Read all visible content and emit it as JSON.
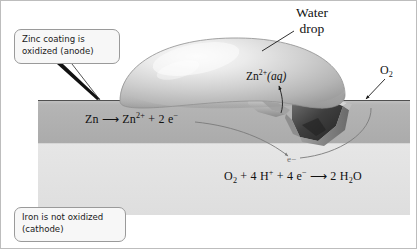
{
  "figure": {
    "background_color": "#ffffff",
    "border_color": "#bdbdbd"
  },
  "callouts": [
    {
      "id": "anode",
      "text": "Zinc coating is\noxidized (anode)",
      "fill": "#f7f7f7",
      "border": "#9a9a9a"
    },
    {
      "id": "cathode",
      "text": "Iron is not oxidized\n(cathode)",
      "fill": "#f7f7f7",
      "border": "#9a9a9a"
    }
  ],
  "labels": {
    "water_drop_line1": "Water",
    "water_drop_line2": "drop",
    "zinc_ion": {
      "species": "Zn",
      "charge": "2+",
      "state": "(aq)"
    },
    "oxygen": {
      "species": "O",
      "count": "2"
    },
    "electron": "e−"
  },
  "equations": {
    "anode": {
      "full": "Zn ⟶ Zn2+ + 2 e−",
      "reactant": "Zn",
      "arrow": "⟶",
      "product_species": "Zn",
      "product_charge": "2+",
      "plus": "+",
      "electrons_count": "2",
      "electron_symbol": "e",
      "electron_charge": "−"
    },
    "cathode": {
      "full": "O2 + 4 H+ + 4 e− ⟶ 2 H2O",
      "o2_species": "O",
      "o2_sub": "2",
      "plus1": "+",
      "h_count": "4",
      "h_species": "H",
      "h_charge": "+",
      "plus2": "+",
      "e_count": "4",
      "e_species": "e",
      "e_charge": "−",
      "arrow": "⟶",
      "water_count": "2",
      "water_h": "H",
      "water_sub": "2",
      "water_o": "O"
    }
  },
  "layers": {
    "zinc_coating": {
      "name": "zinc coating",
      "color_top": "#b9b9b9",
      "color_body": "#b0b0b0",
      "top_y": 100,
      "bottom_y": 145
    },
    "iron_substrate": {
      "name": "iron",
      "color": "#e2e2e2",
      "top_y": 145,
      "bottom_y": 215
    }
  },
  "water_drop": {
    "name": "water drop",
    "highlight_color": "#f2f2f2",
    "mid_color": "#c8c8c8",
    "edge_color": "#9d9d9d",
    "left_x": 120,
    "right_x": 345,
    "top_y": 38,
    "base_y": 108
  },
  "scratch": {
    "name": "scratch in zinc coating exposing iron",
    "dark_color": "#4a4a4a",
    "mid_color": "#7e7e7e",
    "left_x": 255,
    "right_x": 342
  },
  "arrows": {
    "water_drop_leader": "line from Water drop label to drop surface",
    "anode_leader": "tapered pointer from anode callout to zinc surface",
    "zn_ion_arrow": "curved arrow up from scratch to Zn2+(aq) label",
    "o2_arrow": "arrow down-left from O2 label to drop edge",
    "electron_left_curve": "curve from anode equation to e- in iron",
    "electron_right_curve": "curve from right surface down to e- in iron"
  }
}
